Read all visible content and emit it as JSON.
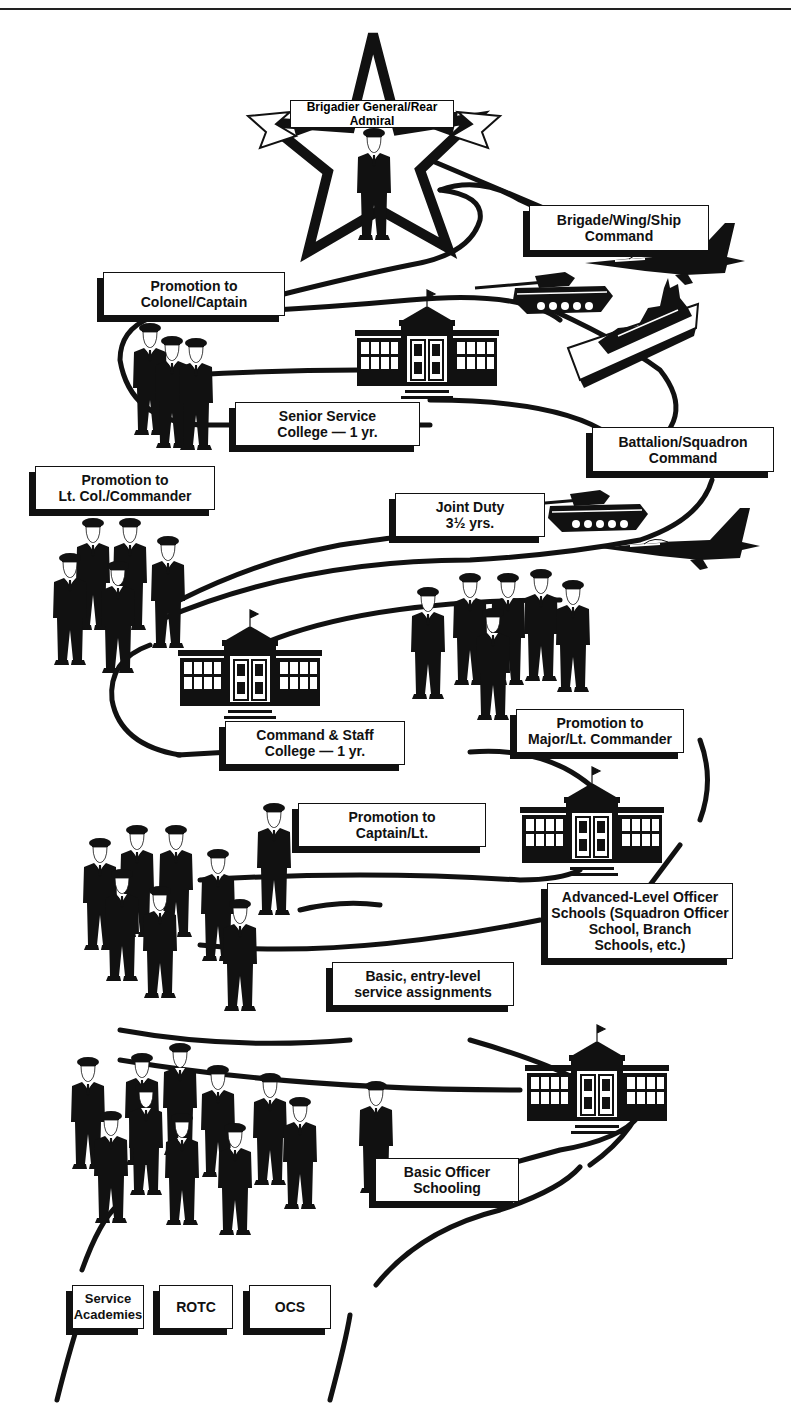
{
  "top_banner": {
    "label": "Brigadier General/Rear Admiral"
  },
  "labels": {
    "brigade_command": {
      "lines": [
        "Brigade/Wing/Ship",
        "Command"
      ]
    },
    "promotion_colonel": {
      "lines": [
        "Promotion to",
        "Colonel/Captain"
      ]
    },
    "senior_service_college": {
      "lines": [
        "Senior Service",
        "College — 1 yr."
      ]
    },
    "battalion_command": {
      "lines": [
        "Battalion/Squadron",
        "Command"
      ]
    },
    "promotion_ltcol": {
      "lines": [
        "Promotion to",
        "Lt. Col./Commander"
      ]
    },
    "joint_duty": {
      "lines": [
        "Joint Duty",
        "3½ yrs."
      ]
    },
    "command_staff_college": {
      "lines": [
        "Command & Staff",
        "College — 1 yr."
      ]
    },
    "promotion_major": {
      "lines": [
        "Promotion to",
        "Major/Lt. Commander"
      ]
    },
    "promotion_captain": {
      "lines": [
        "Promotion to",
        "Captain/Lt."
      ]
    },
    "advanced_schools": {
      "lines": [
        "Advanced-Level Officer",
        "Schools (Squadron Officer",
        "School, Branch",
        "Schools, etc.)"
      ]
    },
    "basic_assignments": {
      "lines": [
        "Basic, entry-level",
        "service assignments"
      ]
    },
    "basic_schooling": {
      "lines": [
        "Basic Officer",
        "Schooling"
      ]
    },
    "service_academies": {
      "lines": [
        "Service",
        "Academies"
      ]
    },
    "rotc": {
      "lines": [
        "ROTC"
      ]
    },
    "ocs": {
      "lines": [
        "OCS"
      ]
    }
  },
  "icons": {
    "star": "star-icon",
    "school": "school-building-icon",
    "officer": "officer-figure-icon",
    "tank": "tank-icon",
    "jet": "fighter-jet-icon",
    "ship": "warship-icon"
  },
  "colors": {
    "ink": "#111111",
    "paper": "#ffffff"
  }
}
